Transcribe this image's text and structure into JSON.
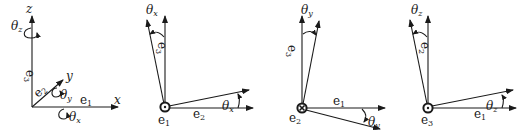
{
  "figure": {
    "panels": [
      {
        "id": "frame",
        "axes": {
          "x": "x",
          "y": "y",
          "z": "z"
        },
        "basis": {
          "e1": "e1",
          "e2": "e2",
          "e3": "e3"
        },
        "rotations": {
          "theta_x": "θx",
          "theta_y": "θy",
          "theta_z": "θz"
        }
      },
      {
        "id": "rotation-x",
        "out_of_plane": "e1",
        "out_of_plane_symbol": "dot",
        "vertical": "e3",
        "horizontal": "e2",
        "angle_top": "θx",
        "angle_bottom": "θx"
      },
      {
        "id": "rotation-y",
        "out_of_plane": "e2",
        "out_of_plane_symbol": "cross",
        "vertical": "e3",
        "horizontal": "e1",
        "angle_top": "θy",
        "angle_bottom": "θy"
      },
      {
        "id": "rotation-z",
        "out_of_plane": "e3",
        "out_of_plane_symbol": "dot",
        "vertical": "e2",
        "horizontal": "e1",
        "angle_top": "θz",
        "angle_bottom": "θz"
      }
    ]
  },
  "labels": {
    "x": "x",
    "y": "y",
    "z": "z",
    "e": "e",
    "theta": "θ",
    "s1": "1",
    "s2": "2",
    "s3": "3",
    "sx": "x",
    "sy": "y",
    "sz": "z"
  }
}
